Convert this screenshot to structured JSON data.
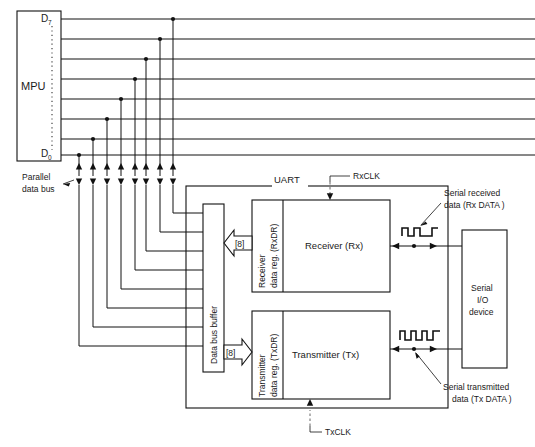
{
  "figure": {
    "type": "block-diagram"
  },
  "mpu": {
    "label": "MPU",
    "pin_top": "D",
    "pin_top_sub": "7",
    "pin_bottom": "D",
    "pin_bottom_sub": "0",
    "bus_label_line1": "Parallel",
    "bus_label_line2": "data bus",
    "bus_width": 8
  },
  "uart": {
    "label": "UART",
    "data_bus_buffer": "Data bus buffer",
    "rx_clock": "RxCLK",
    "tx_clock": "TxCLK",
    "receiver_reg_line1": "Receiver",
    "receiver_reg_line2": "data reg. (RxDR)",
    "transmitter_reg_line1": "Transmitter",
    "transmitter_reg_line2": "data reg. (TxDR)",
    "receiver": "Receiver (Rx)",
    "transmitter": "Transmitter (Tx)",
    "bus_arrow_rx": "[8]",
    "bus_arrow_tx": "[8]"
  },
  "serial_device": {
    "line1": "Serial",
    "line2": "I/O",
    "line3": "device"
  },
  "annotations": {
    "rx_data_line1": "Serial received",
    "rx_data_line2": "data (Rx DATA )",
    "tx_data_line1": "Serial transmitted",
    "tx_data_line2": "data (Tx DATA )"
  },
  "colors": {
    "stroke": "#111111",
    "background": "#ffffff",
    "text": "#1a1a1a"
  }
}
